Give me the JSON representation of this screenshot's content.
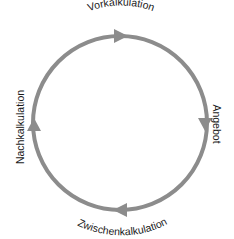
{
  "diagram": {
    "type": "cycle",
    "direction": "clockwise",
    "stroke_color": "#8c8c8c",
    "text_color": "#1a1a1a",
    "background": "#ffffff",
    "stages": [
      {
        "id": "top",
        "label": "Vorkalkulation",
        "arrow": "right"
      },
      {
        "id": "right",
        "label": "Angebot",
        "arrow": "down"
      },
      {
        "id": "bottom",
        "label": "Zwischenkalkulation",
        "arrow": "left"
      },
      {
        "id": "left",
        "label": "Nachkalkulation",
        "arrow": "up"
      }
    ]
  }
}
